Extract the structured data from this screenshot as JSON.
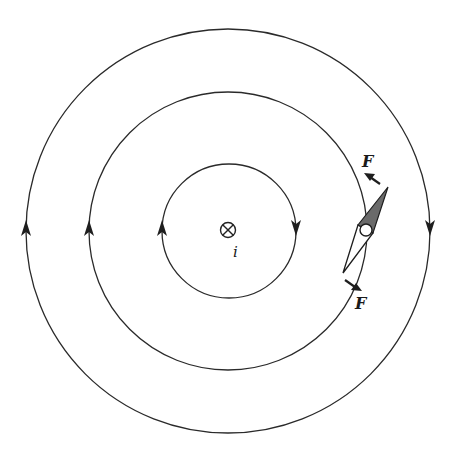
{
  "diagram": {
    "type": "magnetic-field-around-current-carrying-wire",
    "wire": {
      "symbol": "into-page-cross-circle",
      "label": "i",
      "center": [
        228,
        231
      ]
    },
    "field_lines": [
      {
        "name": "inner",
        "radius": 67,
        "direction": "clockwise"
      },
      {
        "name": "middle",
        "radius": 139,
        "direction": "clockwise"
      },
      {
        "name": "outer",
        "radius": 202,
        "direction": "clockwise"
      }
    ],
    "compass_needle": {
      "north_end": "shaded",
      "pivot": "circle"
    },
    "forces": [
      {
        "label": "F",
        "position": "upper"
      },
      {
        "label": "F",
        "position": "lower"
      }
    ],
    "colors": {
      "line": "#2a2a2a",
      "shade": "#6a6a6a",
      "background": "#ffffff"
    }
  }
}
